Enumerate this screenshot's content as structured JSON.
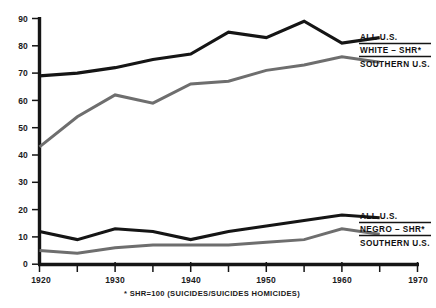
{
  "chart_data": {
    "type": "line",
    "title": "",
    "xlabel": "",
    "ylabel": "",
    "xlim": [
      1920,
      1970
    ],
    "ylim": [
      0,
      90
    ],
    "grid": false,
    "x": [
      1920,
      1925,
      1930,
      1935,
      1940,
      1945,
      1950,
      1955,
      1960,
      1965
    ],
    "x_tick_labels": [
      "1920",
      "1930",
      "1940",
      "1950",
      "1960",
      "1970"
    ],
    "x_tick_values": [
      1920,
      1930,
      1940,
      1950,
      1960,
      1970
    ],
    "x_minor_ticks": [
      1925,
      1935,
      1945,
      1955,
      1965
    ],
    "y_tick_labels": [
      "0",
      "10",
      "20",
      "30",
      "40",
      "50",
      "60",
      "70",
      "80",
      "90"
    ],
    "y_tick_values": [
      0,
      10,
      20,
      30,
      40,
      50,
      60,
      70,
      80,
      90
    ],
    "series": [
      {
        "name": "WHITE - SHR* ALL U.S.",
        "color": "#151515",
        "group": "white",
        "role": "all-us",
        "values": [
          69,
          70,
          72,
          75,
          77,
          85,
          83,
          89,
          81,
          83
        ]
      },
      {
        "name": "WHITE - SHR* SOUTHERN U.S.",
        "color": "#6e6e6e",
        "group": "white",
        "role": "southern-us",
        "values": [
          43,
          54,
          62,
          59,
          66,
          67,
          71,
          73,
          76,
          74
        ]
      },
      {
        "name": "NEGRO - SHR* ALL U.S.",
        "color": "#151515",
        "group": "negro",
        "role": "all-us",
        "values": [
          12,
          9,
          13,
          12,
          9,
          12,
          14,
          16,
          18,
          17
        ]
      },
      {
        "name": "NEGRO - SHR* SOUTHERN U.S.",
        "color": "#6e6e6e",
        "group": "negro",
        "role": "southern-us",
        "values": [
          5,
          4,
          6,
          7,
          7,
          7,
          8,
          9,
          13,
          11
        ]
      }
    ],
    "footnote": "* SHR=100 (SUICIDES/SUICIDES HOMICIDES)",
    "legends": [
      {
        "id": "white",
        "top_label": "ALL U.S.",
        "mid_label": "WHITE – SHR*",
        "bottom_label": "SOUTHERN U.S."
      },
      {
        "id": "negro",
        "top_label": "ALL U.S.",
        "mid_label": "NEGRO – SHR*",
        "bottom_label": "SOUTHERN U.S."
      }
    ],
    "colors": {
      "all_us_line": "#151515",
      "southern_us_line": "#6e6e6e",
      "axis": "#151515",
      "background": "#ffffff"
    }
  }
}
